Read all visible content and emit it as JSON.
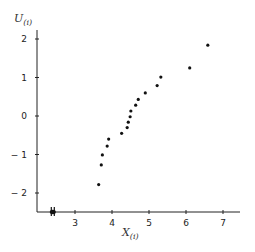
{
  "chart_data": {
    "type": "scatter",
    "title": "",
    "xlabel": "X_(i)",
    "ylabel": "U_(i)",
    "xlabel_main": "X",
    "xlabel_sub": "(i)",
    "ylabel_main": "U",
    "ylabel_sub": "(i)",
    "xlim": [
      2.0,
      7.5
    ],
    "ylim": [
      -2.5,
      2.2
    ],
    "x_ticks": [
      3,
      4,
      5,
      6,
      7
    ],
    "y_ticks": [
      2,
      1,
      0,
      -1,
      -2
    ],
    "x_tick_labels": [
      "3",
      "4",
      "5",
      "6",
      "7"
    ],
    "y_tick_labels": [
      "2",
      "1",
      "0",
      "− 1",
      "− 2"
    ],
    "grid": false,
    "legend": null,
    "axis_break_marker_x": 2.4,
    "series": [
      {
        "name": "order statistics",
        "color": "#111111",
        "x": [
          3.64,
          3.71,
          3.74,
          3.87,
          3.91,
          4.26,
          4.41,
          4.44,
          4.49,
          4.51,
          4.64,
          4.71,
          4.9,
          5.22,
          5.32,
          6.1,
          6.59
        ],
        "y": [
          -1.78,
          -1.27,
          -1.01,
          -0.78,
          -0.6,
          -0.45,
          -0.3,
          -0.16,
          -0.02,
          0.13,
          0.28,
          0.43,
          0.6,
          0.79,
          1.01,
          1.25,
          1.84
        ]
      }
    ]
  }
}
